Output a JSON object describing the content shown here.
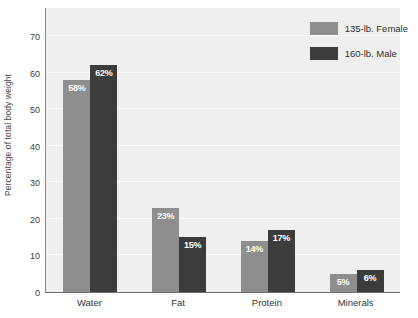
{
  "chart_data": {
    "type": "bar",
    "title": "",
    "xlabel": "",
    "ylabel": "Percentage of total body weight",
    "categories": [
      "Water",
      "Fat",
      "Protein",
      "Minerals"
    ],
    "series": [
      {
        "name": "135-lb. Female",
        "color": "#8e8e8e",
        "values": [
          58,
          23,
          14,
          5
        ],
        "labels": [
          "58%",
          "23%",
          "14%",
          "5%"
        ]
      },
      {
        "name": "160-lb. Male",
        "color": "#3c3c3c",
        "values": [
          62,
          15,
          17,
          6
        ],
        "labels": [
          "62%",
          "15%",
          "17%",
          "6%"
        ]
      }
    ],
    "ylim": [
      0,
      78
    ],
    "yticks": [
      0,
      10,
      20,
      30,
      40,
      50,
      60,
      70
    ],
    "ytick_labels": [
      "0",
      "10",
      "20",
      "30",
      "40",
      "50",
      "60",
      "70"
    ],
    "grid": true,
    "legend_position": "top-right",
    "plot_background": "#efefef",
    "grid_color": "#fbfbfb"
  },
  "legend": {
    "entries": [
      {
        "label": "135-lb. Female",
        "color": "#8e8e8e"
      },
      {
        "label": "160-lb. Male",
        "color": "#3c3c3c"
      }
    ]
  }
}
